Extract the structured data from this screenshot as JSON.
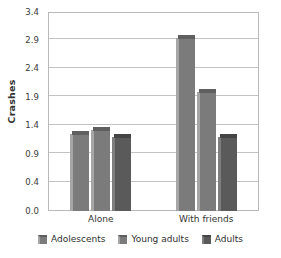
{
  "chart_data": {
    "type": "bar",
    "title": "",
    "xlabel": "",
    "ylabel": "Crashes",
    "categories": [
      "Alone",
      "With friends"
    ],
    "series": [
      {
        "name": "Adolescents",
        "values": [
          1.3,
          3.0
        ],
        "color": "#7b7b7b"
      },
      {
        "name": "Young adults",
        "values": [
          1.38,
          2.05
        ],
        "color": "#7b7b7b"
      },
      {
        "name": "Adults",
        "values": [
          1.25,
          1.25
        ],
        "color": "#5a5a5a"
      }
    ],
    "ylim": [
      0.0,
      3.4
    ],
    "ytick_labels": [
      "0.0",
      "0.4",
      "0.9",
      "1.4",
      "1.9",
      "2.4",
      "2.9",
      "3.4"
    ],
    "ytick_values": [
      0.0,
      0.4,
      0.9,
      1.4,
      1.9,
      2.4,
      2.9,
      3.4
    ],
    "grid": true,
    "legend_position": "bottom"
  },
  "axis": {
    "y_title": "Crashes"
  },
  "legend": {
    "items": [
      {
        "label": "Adolescents"
      },
      {
        "label": "Young adults"
      },
      {
        "label": "Adults"
      }
    ]
  }
}
